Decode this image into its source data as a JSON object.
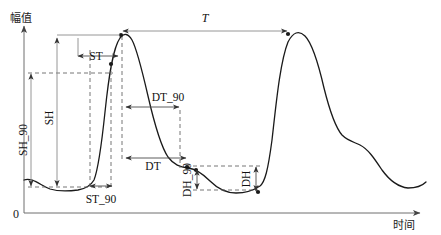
{
  "figure": {
    "title": "",
    "axes": {
      "y_label": "幅值",
      "x_label": "时间",
      "origin_label": "0"
    },
    "parameters": [
      {
        "key": "SH_90",
        "label": "SH_90",
        "orientation": "vertical",
        "kind": "height"
      },
      {
        "key": "SH",
        "label": "SH",
        "orientation": "vertical",
        "kind": "height"
      },
      {
        "key": "ST_90",
        "label": "ST_90",
        "orientation": "horizontal",
        "kind": "time"
      },
      {
        "key": "ST",
        "label": "ST",
        "orientation": "horizontal",
        "kind": "time"
      },
      {
        "key": "T",
        "label": "T",
        "orientation": "horizontal",
        "kind": "period"
      },
      {
        "key": "DT_90",
        "label": "DT_90",
        "orientation": "horizontal",
        "kind": "time"
      },
      {
        "key": "DT",
        "label": "DT",
        "orientation": "horizontal",
        "kind": "time"
      },
      {
        "key": "DH_90",
        "label": "DH_90",
        "orientation": "vertical",
        "kind": "height"
      },
      {
        "key": "DH",
        "label": "DH",
        "orientation": "vertical",
        "kind": "height"
      }
    ],
    "colors": {
      "curve": "#1a1a1a",
      "axis": "#6e6e6e",
      "dashed_guide": "#666666",
      "dimension": "#4a4a4a",
      "background": "#ffffff"
    }
  },
  "chart_data": {
    "type": "line",
    "title": "",
    "xlabel": "时间",
    "ylabel": "幅值",
    "grid": false,
    "legend": false,
    "xlim": [
      0,
      441
    ],
    "ylim": [
      0,
      235
    ],
    "series": [
      {
        "name": "waveform",
        "path": "M 24,180 C 32,177 40,185 50,189 C 60,192 70,191 78,190 C 84,189 90,187 94,180 C 98,170 101,150 105,112 C 109,74 113,48 120,38 C 124,33 128,33 132,40 C 137,49 142,70 148,96 C 154,122 160,145 168,157 C 174,165 180,167 188,168 C 196,169 202,173 210,181 C 218,189 226,193 236,193 C 246,193 254,190 260,186 C 265,182 268,170 272,140 C 276,105 280,62 288,42 C 293,32 299,30 305,36 C 312,43 318,62 324,88 C 330,112 336,128 342,135 C 348,141 354,142 360,145 C 368,149 374,158 382,170 C 390,181 398,187 408,188 C 416,188 422,186 426,182"
      }
    ],
    "key_points": {
      "baseline_start": [
        24,
        180
      ],
      "trough_1": [
        78,
        190
      ],
      "peak_1": [
        120,
        33
      ],
      "shoulder_after_peak_1": [
        188,
        168
      ],
      "trough_2": [
        236,
        193
      ],
      "peak_2": [
        288,
        33
      ],
      "shoulder_tail": [
        345,
        137
      ],
      "trough_3": [
        410,
        188
      ]
    },
    "measurements": {
      "SH_90": {
        "x": 28,
        "y_top": 73,
        "y_bottom": 187,
        "label_rotated": true
      },
      "SH": {
        "x": 57,
        "y_top": 34,
        "y_bottom": 187,
        "label_rotated": true
      },
      "ST_90": {
        "y": 186,
        "x_left": 90,
        "x_right": 111,
        "label_below": true
      },
      "ST": {
        "y": 56,
        "x_left": 78,
        "x_right": 117,
        "label_inside": true
      },
      "T": {
        "y": 31,
        "x_left": 122,
        "x_right": 287
      },
      "DT_90": {
        "y": 107,
        "x_left": 125,
        "x_right": 180,
        "label_above": true
      },
      "DT": {
        "y": 158,
        "x_left": 125,
        "x_right": 186,
        "label_inside": true
      },
      "DH_90": {
        "x": 193,
        "y_top": 163,
        "y_bottom": 190,
        "label_rotated": true
      },
      "DH": {
        "x": 250,
        "y_top": 160,
        "y_bottom": 192,
        "label_rotated": true
      }
    }
  }
}
